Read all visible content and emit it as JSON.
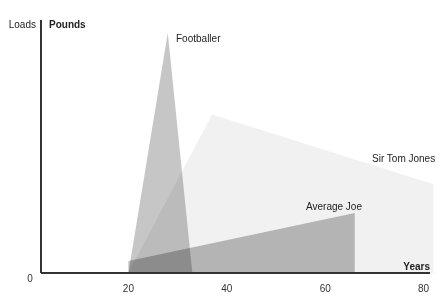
{
  "chart_data": {
    "type": "area",
    "title": "",
    "xlabel": "Years",
    "ylabel_left": "Loads",
    "ylabel_right": "Pounds",
    "y_origin_label": "0",
    "xlim": [
      0,
      82
    ],
    "ylim": [
      0,
      100
    ],
    "x_ticks": [
      20,
      40,
      60,
      80
    ],
    "grid": false,
    "legend": "none (direct labels)",
    "series": [
      {
        "name": "Sir Tom Jones",
        "color": "#efefef",
        "points": [
          [
            20,
            0
          ],
          [
            37,
            66
          ],
          [
            82,
            37
          ],
          [
            82,
            0
          ]
        ]
      },
      {
        "name": "Average Joe",
        "color": "#a9a9a9",
        "points": [
          [
            20,
            0
          ],
          [
            20,
            5
          ],
          [
            66,
            25
          ],
          [
            66,
            0
          ]
        ]
      },
      {
        "name": "Footballer",
        "color": "#b3b3b3",
        "points": [
          [
            20,
            0
          ],
          [
            28,
            100
          ],
          [
            33,
            0
          ]
        ]
      }
    ],
    "annotations": [
      {
        "text": "Footballer",
        "series": "Footballer"
      },
      {
        "text": "Sir Tom Jones",
        "series": "Sir Tom Jones"
      },
      {
        "text": "Average Joe",
        "series": "Average Joe"
      }
    ]
  }
}
